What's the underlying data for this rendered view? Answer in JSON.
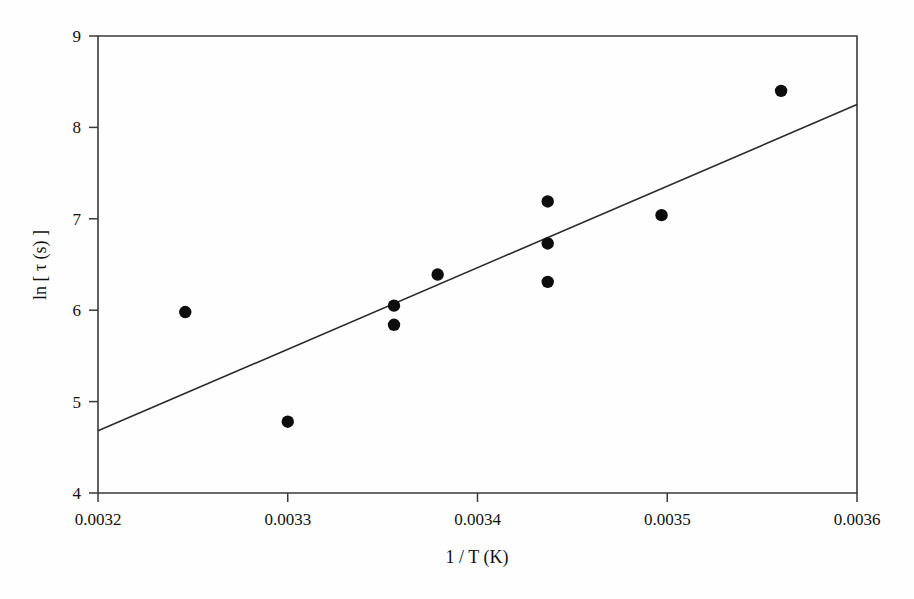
{
  "chart_data": {
    "type": "scatter",
    "title": "",
    "xlabel": "1 / T (K)",
    "ylabel": "ln [ τ (s) ]",
    "ylabel_parts": {
      "prefix": "ln [ ",
      "symbol": "τ",
      "unit": " (s) ",
      "suffix": "]"
    },
    "xlim": [
      0.0032,
      0.0036
    ],
    "ylim": [
      4,
      9
    ],
    "xticks": [
      0.0032,
      0.0033,
      0.0034,
      0.0035,
      0.0036
    ],
    "xtick_labels": [
      "0.0032",
      "0.0033",
      "0.0034",
      "0.0035",
      "0.0036"
    ],
    "yticks": [
      4,
      5,
      6,
      7,
      8,
      9
    ],
    "ytick_labels": [
      "4",
      "5",
      "6",
      "7",
      "8",
      "9"
    ],
    "grid": false,
    "legend": "none",
    "marker": "filled-circle",
    "marker_color": "#0d0d0d",
    "line_color": "#2b2b2b",
    "frame_color": "#3a3a3a",
    "background_color": "#ffffff",
    "points": [
      {
        "x": 0.003246,
        "y": 5.98
      },
      {
        "x": 0.0033,
        "y": 4.78
      },
      {
        "x": 0.003356,
        "y": 6.05
      },
      {
        "x": 0.003356,
        "y": 5.84
      },
      {
        "x": 0.003379,
        "y": 6.39
      },
      {
        "x": 0.003437,
        "y": 7.19
      },
      {
        "x": 0.003437,
        "y": 6.73
      },
      {
        "x": 0.003437,
        "y": 6.31
      },
      {
        "x": 0.003497,
        "y": 7.04
      },
      {
        "x": 0.00356,
        "y": 8.4
      }
    ],
    "fit_line": {
      "x_start": 0.0032,
      "y_start": 4.68,
      "x_end": 0.0036,
      "y_end": 8.25
    }
  },
  "axes": {
    "x_axis_name": "x-axis",
    "y_axis_name": "y-axis"
  }
}
